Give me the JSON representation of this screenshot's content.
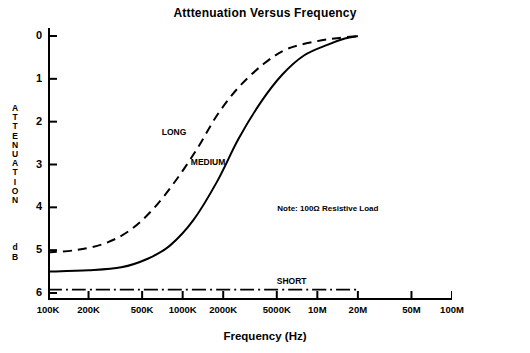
{
  "chart_data": {
    "type": "line",
    "title": "Atttenuation Versus Frequency",
    "xlabel": "Frequency  (Hz)",
    "ylabel_letters": [
      "A",
      "T",
      "T",
      "E",
      "N",
      "U",
      "A",
      "T",
      "I",
      "O",
      "N"
    ],
    "ylabel_unit": [
      "d",
      "B"
    ],
    "x_ticks": [
      "100K",
      "200K",
      "500K",
      "1000K",
      "2000K",
      "5000K",
      "10M",
      "20M",
      "50M",
      "100M"
    ],
    "y_ticks": [
      "0",
      "1",
      "2",
      "3",
      "4",
      "5",
      "6"
    ],
    "ylim": [
      0,
      6
    ],
    "y_inverted": true,
    "grid": false,
    "legend": "inline-labels",
    "annotations": [
      {
        "text": "Note:  100Ω Resistive Load",
        "x": "10M",
        "y": 4.05
      }
    ],
    "series": [
      {
        "name": "LONG",
        "style": "dashed",
        "label_x": "700K",
        "label_y": 2.25,
        "points": [
          {
            "x": "100K",
            "y": 5.05
          },
          {
            "x": "160K",
            "y": 5.0
          },
          {
            "x": "260K",
            "y": 4.85
          },
          {
            "x": "400K",
            "y": 4.55
          },
          {
            "x": "600K",
            "y": 4.05
          },
          {
            "x": "900K",
            "y": 3.35
          },
          {
            "x": "1300K",
            "y": 2.6
          },
          {
            "x": "1800K",
            "y": 1.85
          },
          {
            "x": "2600K",
            "y": 1.2
          },
          {
            "x": "4000K",
            "y": 0.65
          },
          {
            "x": "6000K",
            "y": 0.3
          },
          {
            "x": "10M",
            "y": 0.12
          },
          {
            "x": "14M",
            "y": 0.05
          },
          {
            "x": "20M",
            "y": 0.0
          }
        ]
      },
      {
        "name": "MEDIUM",
        "style": "solid",
        "label_x": "1150K",
        "label_y": 2.95,
        "points": [
          {
            "x": "100K",
            "y": 5.5
          },
          {
            "x": "200K",
            "y": 5.47
          },
          {
            "x": "350K",
            "y": 5.4
          },
          {
            "x": "550K",
            "y": 5.2
          },
          {
            "x": "800K",
            "y": 4.9
          },
          {
            "x": "1200K",
            "y": 4.3
          },
          {
            "x": "1800K",
            "y": 3.4
          },
          {
            "x": "2600K",
            "y": 2.4
          },
          {
            "x": "3800K",
            "y": 1.55
          },
          {
            "x": "5500K",
            "y": 0.9
          },
          {
            "x": "8000K",
            "y": 0.45
          },
          {
            "x": "12M",
            "y": 0.2
          },
          {
            "x": "16M",
            "y": 0.06
          },
          {
            "x": "20M",
            "y": 0.0
          }
        ]
      },
      {
        "name": "SHORT",
        "style": "dash-dot",
        "label_x": "5000K",
        "label_y": 5.72,
        "points": [
          {
            "x": "100K",
            "y": 5.92
          },
          {
            "x": "20M",
            "y": 5.92
          }
        ]
      }
    ]
  }
}
